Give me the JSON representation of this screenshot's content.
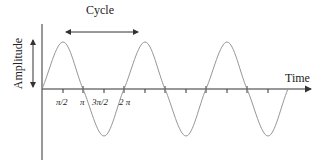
{
  "diagram": {
    "title": "Cycle",
    "x_axis_label": "Time",
    "y_axis_label": "Amplitude",
    "tick_labels": [
      "π/2",
      "π",
      "3π/2",
      "2 π"
    ],
    "waveform": "sine",
    "cycles_shown": 3,
    "colors": {
      "curve": "#8a8a8a",
      "axis": "#333333",
      "text": "#222222"
    }
  }
}
